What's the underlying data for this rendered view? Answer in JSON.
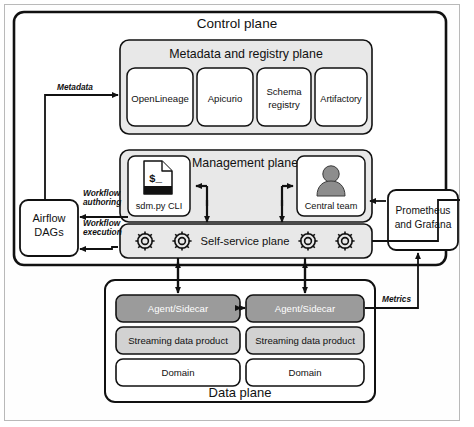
{
  "diagram": {
    "control_plane": {
      "label": "Control plane"
    },
    "metadata_plane": {
      "label": "Metadata and registry plane",
      "items": [
        {
          "label": "OpenLineage"
        },
        {
          "label": "Apicurio"
        },
        {
          "label": "Schema registry",
          "line1": "Schema",
          "line2": "registry"
        },
        {
          "label": "Artifactory"
        }
      ]
    },
    "management_plane": {
      "label": "Management plane",
      "cli": {
        "label": "sdm.py CLI",
        "icon": "terminal-document-icon",
        "glyph": "$_"
      },
      "team": {
        "label": "Central team",
        "icon": "person-avatar-icon"
      }
    },
    "self_service_plane": {
      "label": "Self-service plane",
      "gears": [
        "gear-icon",
        "gear-icon",
        "gear-icon",
        "gear-icon"
      ]
    },
    "data_plane": {
      "label": "Data plane",
      "domains": [
        {
          "agent": "Agent/Sidecar",
          "product": "Streaming data product",
          "domain": "Domain"
        },
        {
          "agent": "Agent/Sidecar",
          "product": "Streaming data product",
          "domain": "Domain"
        }
      ]
    },
    "external": {
      "airflow": {
        "line1": "Airflow",
        "line2": "DAGs"
      },
      "observability": {
        "line1": "Prometheus",
        "line2": "and Grafana"
      }
    },
    "edge_labels": {
      "metadata": "Metadata",
      "workflow_authoring_l1": "Workflow",
      "workflow_authoring_l2": "authoring",
      "workflow_execution_l1": "Workflow",
      "workflow_execution_l2": "execution",
      "metrics": "Metrics"
    },
    "colors": {
      "plane_fill": "#e8e8e8",
      "agent_fill": "#9b9b9b",
      "product_fill": "#d2d2d2",
      "white": "#ffffff",
      "stroke": "#111111",
      "frame": "#b9b9b9"
    }
  }
}
